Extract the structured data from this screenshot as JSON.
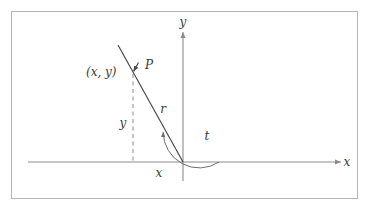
{
  "figure": {
    "frame": {
      "stroke": "#b4b4b4",
      "fill": "#ffffff",
      "x": 11,
      "y": 11,
      "width": 347,
      "height": 188
    },
    "colors": {
      "axis": "#8c8c8c",
      "ray": "#4a4a4a",
      "dashed": "#8c8c8c",
      "arc": "#6e6e6e",
      "text": "#3b3b3b"
    },
    "geometry": {
      "origin": {
        "x": 183,
        "y": 162
      },
      "point_p": {
        "x": 133,
        "y": 72
      },
      "ray_tip": {
        "x": 118,
        "y": 45
      },
      "x_axis": {
        "x1": 28,
        "x2": 345,
        "y": 162
      },
      "y_axis": {
        "x": 183,
        "y1": 28,
        "y2": 181
      },
      "arc_radius": 36
    },
    "labels": {
      "x_axis": "x",
      "y_axis": "y",
      "point_name": "P",
      "coordinates": "(x, y)",
      "radius": "r",
      "angle": "t",
      "leg_vertical": "y",
      "leg_horizontal": "x"
    }
  }
}
